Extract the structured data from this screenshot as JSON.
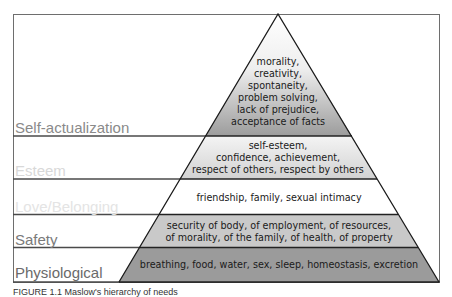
{
  "diagram": {
    "title": "Maslow's hierarchy of needs",
    "levels": [
      {
        "name": "Self-actualization",
        "label_color": "#8a8a8a",
        "lines": [
          "morality,",
          "creativity,",
          "spontaneity,",
          "problem solving,",
          "lack of prejudice,",
          "acceptance of facts"
        ],
        "fill": "gradient white to #9a9a9a"
      },
      {
        "name": "Esteem",
        "label_color": "#d6d6d6",
        "lines": [
          "self-esteem,",
          "confidence, achievement,",
          "respect of others, respect by others"
        ],
        "fill": "gradient white to #cfcfcf"
      },
      {
        "name": "Love/Belonging",
        "label_color": "#e2e2e2",
        "lines": [
          "friendship, family, sexual intimacy"
        ],
        "fill": "#ffffff"
      },
      {
        "name": "Safety",
        "label_color": "#7a7a7a",
        "lines": [
          "security of body, of employment, of resources,",
          "of morality, of the family, of health, of property"
        ],
        "fill": "#c8c8c8"
      },
      {
        "name": "Physiological",
        "label_color": "#6a6a6a",
        "lines": [
          "breathing, food, water, sex, sleep, homeostasis, excretion"
        ],
        "fill": "#9a9a9a"
      }
    ]
  },
  "caption": {
    "text": "FIGURE 1.1 Maslow's hierarchy of needs"
  }
}
